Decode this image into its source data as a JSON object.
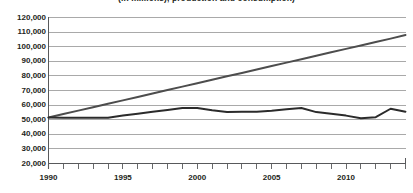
{
  "chart_data": {
    "type": "line",
    "title": "(in millions), production and consumption)",
    "xlabel": "",
    "ylabel": "",
    "x": [
      1990,
      1991,
      1992,
      1993,
      1994,
      1995,
      1996,
      1997,
      1998,
      1999,
      2000,
      2001,
      2002,
      2003,
      2004,
      2005,
      2006,
      2007,
      2008,
      2009,
      2010,
      2011,
      2012,
      2013,
      2014
    ],
    "xlim": [
      1990,
      2014
    ],
    "ylim": [
      20000,
      120000
    ],
    "yticks": [
      20000,
      30000,
      40000,
      50000,
      60000,
      70000,
      80000,
      90000,
      100000,
      110000,
      120000
    ],
    "ytick_labels": [
      "20,000",
      "30,000",
      "40,000",
      "50,000",
      "60,000",
      "70,000",
      "80,000",
      "90,000",
      "100,000",
      "110,000",
      "120,000"
    ],
    "xticks": [
      1990,
      1991,
      1992,
      1993,
      1994,
      1995,
      1996,
      1997,
      1998,
      1999,
      2000,
      2001,
      2002,
      2003,
      2004,
      2005,
      2006,
      2007,
      2008,
      2009,
      2010,
      2011,
      2012,
      2013,
      2014
    ],
    "xtick_labels": [
      {
        "value": 1990,
        "label": "1990"
      },
      {
        "value": 1995,
        "label": "1995"
      },
      {
        "value": 2000,
        "label": "2000"
      },
      {
        "value": 2005,
        "label": "2005"
      },
      {
        "value": 2010,
        "label": "2010"
      }
    ],
    "grid": true,
    "grid_color": "#9a9a9a",
    "axis_color": "#58595b",
    "legend": "none",
    "series": [
      {
        "name": "rising-trend-line",
        "color": "#4d4d4d",
        "values": [
          51500,
          53850,
          56200,
          58550,
          60900,
          63250,
          65600,
          67950,
          70300,
          72650,
          75000,
          77350,
          79700,
          82050,
          84400,
          86750,
          89100,
          91450,
          93800,
          96150,
          98500,
          100850,
          103200,
          105550,
          108000
        ]
      },
      {
        "name": "fluctuating-line",
        "color": "#2b2b2b",
        "values": [
          51500,
          51400,
          51400,
          51400,
          51400,
          52800,
          54100,
          55400,
          56700,
          58000,
          58000,
          56400,
          55300,
          55400,
          55500,
          56200,
          57200,
          58000,
          55200,
          54000,
          52800,
          51000,
          51700,
          57500,
          55500
        ]
      }
    ]
  }
}
